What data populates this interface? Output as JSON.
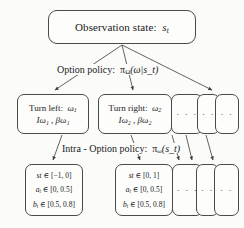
{
  "diagram": {
    "title_text": "Hierarchical option-critic policy diagram",
    "background_color": "#fbfbfa",
    "stroke_color": "#4a4a4a",
    "levels": {
      "observation": {
        "label": "Observation state:",
        "symbol": "s",
        "symbol_sub": "t",
        "full_text": "Observation state: s_t"
      },
      "option_policy_label": {
        "prefix": "Option policy:",
        "symbol": "π",
        "symbol_sub": "Ω",
        "args": "(ω|s_t)",
        "full_text": "Option policy: πΩ(ω|s_t)"
      },
      "intra_option_policy_label": {
        "prefix": "Intra - Option policy:",
        "symbol": "π",
        "symbol_sub": "ω",
        "args": "(s_t)",
        "full_text": "Intra - Option policy: πω(s_t)"
      }
    },
    "option_boxes": [
      {
        "name": "turn-left",
        "line1_text": "Turn left:",
        "line1_symbol": "ω",
        "line1_sub": "1",
        "line2_text": "Iω₁ , βω₁",
        "is_ellipsis": false
      },
      {
        "name": "turn-right",
        "line1_text": "Turn right:",
        "line1_symbol": "ω",
        "line1_sub": "2",
        "line2_text": "Iω₂ , βω₂",
        "is_ellipsis": false
      },
      {
        "name": "option-ellipsis-1",
        "dots": "· · ·",
        "is_ellipsis": true
      },
      {
        "name": "option-ellipsis-2",
        "dots": "· ·",
        "is_ellipsis": true
      },
      {
        "name": "option-ellipsis-3",
        "dots": "· ·",
        "is_ellipsis": true
      }
    ],
    "action_boxes": [
      {
        "name": "action-left",
        "rows": [
          {
            "var": "st",
            "op": "∈",
            "range": "[−1, 0]"
          },
          {
            "var": "a",
            "sub": "t",
            "op": "∈",
            "range": "[0, 0.5]"
          },
          {
            "var": "b",
            "sub": "t",
            "op": "∈",
            "range": "[0.5, 0.8]"
          }
        ],
        "is_ellipsis": false
      },
      {
        "name": "action-right",
        "rows": [
          {
            "var": "st",
            "op": "∈",
            "range": "[0, 1]"
          },
          {
            "var": "a",
            "sub": "t",
            "op": "∈",
            "range": "[0, 0.5]"
          },
          {
            "var": "b",
            "sub": "t",
            "op": "∈",
            "range": "[0.5, 0.8]"
          }
        ],
        "is_ellipsis": false
      },
      {
        "name": "action-ellipsis-1",
        "dots": "· · ·",
        "is_ellipsis": true
      },
      {
        "name": "action-ellipsis-2",
        "dots": "· ·",
        "is_ellipsis": true
      },
      {
        "name": "action-ellipsis-3",
        "dots": "· ·",
        "is_ellipsis": true
      }
    ]
  }
}
